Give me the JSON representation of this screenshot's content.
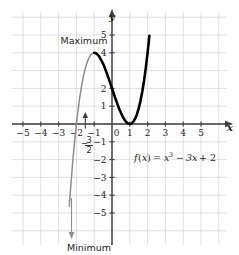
{
  "figure": {
    "equation_text": "f(x) = x³ − 3x + 2",
    "equation_parts": {
      "fname": "f",
      "fopen": "(",
      "fvar": "x",
      "fclose": ")",
      "equals": "=",
      "term1_base": "x",
      "term1_exp": "3",
      "minus": "−",
      "term2": "3x",
      "plus": "+",
      "term3": "2"
    },
    "annotations": {
      "maximum_label": "Maximum",
      "minimum_label": "Minimum",
      "fraction_label": {
        "sign": "−",
        "numerator": "3",
        "denominator": "2"
      }
    },
    "axis_names": {
      "x": "x",
      "y": "y"
    },
    "colors": {
      "grid": "#d8d8dc",
      "axis": "#3c3c3c",
      "curve_highlight": "#000000",
      "curve_faded": "#8d8d92",
      "text": "#231f20",
      "background": "#ffffff"
    }
  },
  "chart_data": {
    "type": "line",
    "title": "",
    "subtitle": "",
    "xlabel": "x",
    "ylabel": "y",
    "equation": "f(x) = x^3 - 3x + 2",
    "xlim": [
      -6,
      6
    ],
    "ylim": [
      -6,
      6
    ],
    "grid": true,
    "grid_step": 1,
    "legend": null,
    "legend_position": "none",
    "x_ticks": [
      -5,
      -4,
      -3,
      -2,
      -1,
      0,
      1,
      2,
      3,
      4,
      5
    ],
    "x_tick_labels": [
      "−5",
      "−4",
      "−3",
      "−2",
      "−1",
      "0",
      "1",
      "2",
      "3",
      "4",
      "5"
    ],
    "y_ticks": [
      -5,
      -4,
      -3,
      -2,
      -1,
      1,
      2,
      4,
      5
    ],
    "y_tick_labels": [
      "−5",
      "−4",
      "−3",
      "−2",
      "−1",
      "1",
      "2",
      "4",
      "5"
    ],
    "special_x_tick": {
      "value": -1.5,
      "label": "-3/2",
      "label_display": "−³⁄₂"
    },
    "series": [
      {
        "name": "f(x) = x^3 - 3x + 2",
        "style": "solid",
        "x": [
          -2.4,
          -2.3,
          -2.2,
          -2.1,
          -2.0,
          -1.9,
          -1.8,
          -1.7,
          -1.6,
          -1.5,
          -1.4,
          -1.3,
          -1.2,
          -1.1,
          -1.0,
          -0.9,
          -0.8,
          -0.7,
          -0.6,
          -0.5,
          -0.4,
          -0.3,
          -0.2,
          -0.1,
          0.0,
          0.1,
          0.2,
          0.3,
          0.4,
          0.5,
          0.6,
          0.7,
          0.8,
          0.9,
          1.0,
          1.1,
          1.2,
          1.3,
          1.4,
          1.5,
          1.6,
          1.7,
          1.8,
          1.9,
          2.0,
          2.1
        ],
        "y": [
          -4.62,
          -3.27,
          -2.05,
          -0.96,
          0.0,
          0.84,
          1.57,
          2.19,
          2.71,
          3.13,
          3.46,
          3.7,
          3.87,
          3.97,
          4.0,
          3.97,
          3.89,
          3.76,
          3.58,
          3.38,
          3.14,
          2.87,
          2.59,
          2.3,
          2.0,
          1.7,
          1.41,
          1.13,
          0.86,
          0.63,
          0.42,
          0.24,
          0.11,
          0.03,
          0.0,
          0.03,
          0.13,
          0.3,
          0.54,
          0.88,
          1.3,
          1.81,
          2.43,
          3.16,
          4.0,
          4.96
        ]
      }
    ],
    "key_points": [
      {
        "label": "Maximum",
        "x": -1,
        "y": 4
      },
      {
        "label": "Minimum",
        "x": 1,
        "y": 0
      },
      {
        "label": "y-intercept",
        "x": 0,
        "y": 2
      },
      {
        "label": "x-intercept",
        "x": -2,
        "y": 0
      },
      {
        "label": "x-intercept (double root)",
        "x": 1,
        "y": 0
      }
    ],
    "annotations": [
      {
        "text": "Maximum",
        "points_to_x": -1,
        "points_to_y": 4
      },
      {
        "text": "Minimum",
        "points_to_x": -1.5,
        "points_to_y": -6
      },
      {
        "text": "f(x) = x³ − 3x + 2",
        "x": 0.4,
        "y": -1.6
      }
    ]
  }
}
